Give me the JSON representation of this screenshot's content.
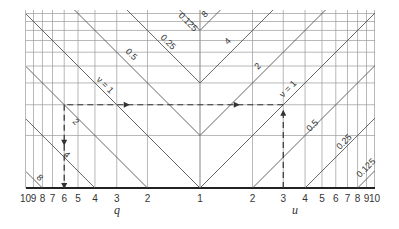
{
  "diagram": {
    "left_axis": {
      "title": "q",
      "ticks": [
        "10",
        "9",
        "8",
        "7",
        "6",
        "5",
        "4",
        "3",
        "2"
      ]
    },
    "center_tick": "1",
    "right_axis": {
      "title": "u",
      "ticks": [
        "2",
        "3",
        "4",
        "5",
        "6",
        "7",
        "8",
        "9",
        "10"
      ]
    },
    "left_curves": [
      {
        "label": "8",
        "value": 8
      },
      {
        "label": "4",
        "value": 4
      },
      {
        "label": "2",
        "value": 2
      },
      {
        "label": "ν = 1",
        "value": 1
      },
      {
        "label": "0.5",
        "value": 0.5
      },
      {
        "label": "0.25",
        "value": 0.25
      },
      {
        "label": "0.125",
        "value": 0.125
      }
    ],
    "right_curves": [
      {
        "label": "8",
        "value": 8
      },
      {
        "label": "4",
        "value": 4
      },
      {
        "label": "2",
        "value": 2
      },
      {
        "label": "ν = 1",
        "value": 1
      },
      {
        "label": "0.5",
        "value": 0.5
      },
      {
        "label": "0.25",
        "value": 0.25
      },
      {
        "label": "0.125",
        "value": 0.125
      }
    ],
    "example_path": {
      "start_u": 3,
      "curve": "ν = 1",
      "end_q": 6
    },
    "colors": {
      "line": "#555555",
      "grid": "#9a9a9a",
      "axis": "#222222",
      "dash": "#333333"
    }
  }
}
